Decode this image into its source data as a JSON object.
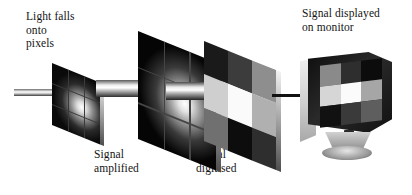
{
  "figure": {
    "type": "process-diagram",
    "background_color": "#ffffff"
  },
  "labels": {
    "light": "Light falls\nonto\npixels",
    "amplified": "Signal\namplified",
    "digitised": "Signal\ndigitised",
    "monitor": "Signal displayed\non monitor"
  },
  "stages": [
    {
      "id": "pixels",
      "name": "pixel-array-panel",
      "caption": "Light falls onto pixels",
      "rendering": "gradient",
      "grid": "3x3"
    },
    {
      "id": "amplified",
      "name": "amplified-panel",
      "caption": "Signal amplified",
      "rendering": "gradient",
      "grid": "3x3"
    },
    {
      "id": "digitised",
      "name": "digitised-panel",
      "caption": "Signal digitised",
      "rendering": "quantised",
      "grid": "3x3"
    },
    {
      "id": "monitor",
      "name": "monitor-display",
      "caption": "Signal displayed on monitor",
      "rendering": "quantised",
      "grid": "3x3"
    }
  ],
  "digitised_cells": [
    "#1a1a1a",
    "#3c3c3c",
    "#8e8e8e",
    "#cfcfcf",
    "#fafafa",
    "#b0b0b0",
    "#707070",
    "#0d0d0d",
    "#2e2e2e"
  ],
  "monitor_cells": [
    "#8a8a8a",
    "#2e2e2e",
    "#0c0c0c",
    "#d6d6d6",
    "#fbfbfb",
    "#a6a6a6",
    "#111111",
    "#3a3a3a",
    "#5e5e5e"
  ],
  "arrows": [
    {
      "name": "light-beam-in",
      "style": "gradient-beam",
      "thin": true
    },
    {
      "name": "beam-to-amplified",
      "style": "gradient-beam",
      "thin": false
    },
    {
      "name": "beam-to-digitised",
      "style": "gradient-beam",
      "thin": false
    },
    {
      "name": "arrow-to-monitor",
      "style": "solid-line",
      "color": "#121212"
    }
  ],
  "colors": {
    "ink": "#141414",
    "panel_edge_light": "#f2f2f2",
    "panel_edge_dark": "#4d4d4d",
    "monitor_case": "#e6e6e6"
  }
}
